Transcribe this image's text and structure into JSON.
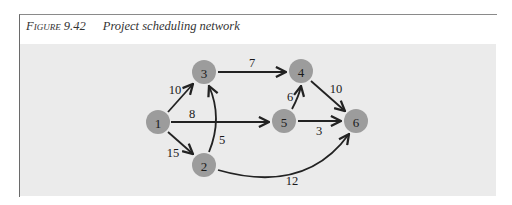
{
  "caption": {
    "figure_label": "Figure 9.42",
    "title": "Project scheduling network"
  },
  "nodes": [
    {
      "id": "1",
      "label": "1",
      "x": 158,
      "y": 122
    },
    {
      "id": "2",
      "label": "2",
      "x": 204,
      "y": 165
    },
    {
      "id": "3",
      "label": "3",
      "x": 204,
      "y": 72
    },
    {
      "id": "4",
      "label": "4",
      "x": 301,
      "y": 71
    },
    {
      "id": "5",
      "label": "5",
      "x": 284,
      "y": 121
    },
    {
      "id": "6",
      "label": "6",
      "x": 356,
      "y": 121
    }
  ],
  "edges": [
    {
      "from": "1",
      "to": "3",
      "weight": "10"
    },
    {
      "from": "1",
      "to": "5",
      "weight": "8"
    },
    {
      "from": "1",
      "to": "2",
      "weight": "15"
    },
    {
      "from": "2",
      "to": "3",
      "weight": "5"
    },
    {
      "from": "3",
      "to": "4",
      "weight": "7"
    },
    {
      "from": "5",
      "to": "4",
      "weight": "6"
    },
    {
      "from": "4",
      "to": "6",
      "weight": "10"
    },
    {
      "from": "5",
      "to": "6",
      "weight": "3"
    },
    {
      "from": "2",
      "to": "6",
      "weight": "12"
    }
  ]
}
